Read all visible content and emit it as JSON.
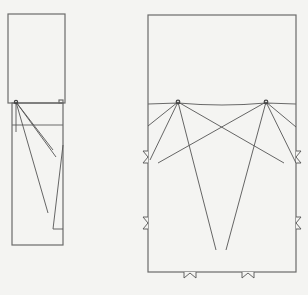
{
  "diagram": {
    "colors": {
      "background": "#f4f4f2",
      "line": "#555555",
      "wall": "#6a6a6a"
    },
    "left_room": {
      "label": "",
      "upper_box": {
        "x": 8,
        "y": 14,
        "w": 57,
        "h": 89
      },
      "lower_box": {
        "x": 12,
        "y": 103,
        "w": 51,
        "h": 142
      },
      "source": {
        "x": 16,
        "y": 102
      },
      "marker": {
        "x": 59,
        "y": 100,
        "w": 4,
        "h": 3
      },
      "cross_line_y": 125,
      "rays": [
        {
          "x2": 16,
          "y2": 132
        },
        {
          "x2": 48,
          "y2": 213
        },
        {
          "x2": 56,
          "y2": 157
        },
        {
          "x2": 53,
          "y2": 150
        }
      ],
      "return_line": [
        [
          63,
          145
        ],
        [
          53,
          229
        ],
        [
          63,
          229
        ]
      ]
    },
    "right_room": {
      "label": "",
      "box": {
        "x": 148,
        "y": 15,
        "w": 148,
        "h": 257
      },
      "ceiling_line_y": 104,
      "sources": [
        {
          "x": 178,
          "y": 102
        },
        {
          "x": 266,
          "y": 102
        }
      ],
      "rays_from_source_1": [
        {
          "x2": 148,
          "y2": 126
        },
        {
          "x2": 150,
          "y2": 160
        },
        {
          "x2": 216,
          "y2": 250
        },
        {
          "x2": 284,
          "y2": 163
        }
      ],
      "rays_from_source_2": [
        {
          "x2": 158,
          "y2": 163
        },
        {
          "x2": 226,
          "y2": 250
        },
        {
          "x2": 296,
          "y2": 127
        },
        {
          "x2": 296,
          "y2": 163
        }
      ],
      "openings_left": [
        {
          "y": 157
        },
        {
          "y": 223
        }
      ],
      "openings_right": [
        {
          "y": 157
        },
        {
          "y": 223
        }
      ],
      "openings_bottom": [
        {
          "x": 190
        },
        {
          "x": 248
        }
      ]
    }
  }
}
